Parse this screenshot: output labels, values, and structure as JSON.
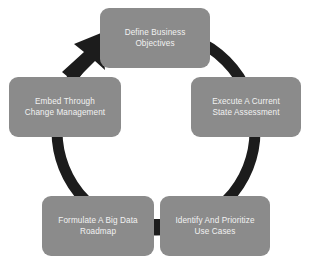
{
  "diagram": {
    "type": "cycle",
    "direction": "clockwise",
    "background_color": "#ffffff",
    "ring_color": "#1c1c1c",
    "node_fill_color": "#8b8b8b",
    "node_text_color": "#f2f2f2",
    "node_count": 5,
    "arrow": {
      "name": "cycle-arrowhead",
      "position": "upper-left",
      "points_to": "Define Business Objectives"
    },
    "nodes": [
      {
        "id": "define",
        "position": "top",
        "order": 1,
        "label": "Define Business\nObjectives",
        "line1": "Define Business",
        "line2": "Objectives"
      },
      {
        "id": "execute",
        "position": "right",
        "order": 2,
        "label": "Execute A Current\nState Assessment",
        "line1": "Execute A Current",
        "line2": "State Assessment"
      },
      {
        "id": "identify",
        "position": "bottom-right",
        "order": 3,
        "label": "Identify And Prioritize\nUse Cases",
        "line1": "Identify And Prioritize",
        "line2": "Use Cases"
      },
      {
        "id": "formulate",
        "position": "bottom-left",
        "order": 4,
        "label": "Formulate A Big Data\nRoadmap",
        "line1": "Formulate A Big Data",
        "line2": "Roadmap"
      },
      {
        "id": "embed",
        "position": "left",
        "order": 5,
        "label": "Embed Through\nChange Management",
        "line1": "Embed Through",
        "line2": "Change Management"
      }
    ]
  }
}
